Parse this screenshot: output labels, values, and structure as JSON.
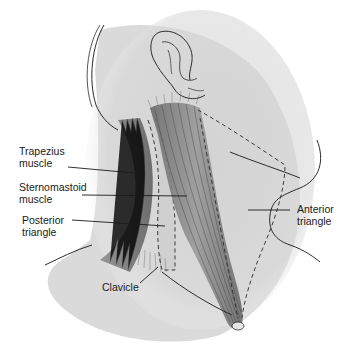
{
  "diagram": {
    "labels": [
      {
        "id": "trapezius",
        "text": "Trapezius\nmuscle",
        "x": 19,
        "y": 145
      },
      {
        "id": "sternomastoid",
        "text": "Sternomastoid\nmuscle",
        "x": 19,
        "y": 181
      },
      {
        "id": "posterior-triangle",
        "text": "Posterior\ntriangle",
        "x": 22,
        "y": 215
      },
      {
        "id": "anterior-triangle",
        "text": "Anterior\ntriangle",
        "x": 300,
        "y": 204
      },
      {
        "id": "clavicle",
        "text": "Clavicle",
        "x": 102,
        "y": 282
      }
    ],
    "colors": {
      "skin_shade": "#d9d9d9",
      "outline": "#2a2a2a",
      "muscle": "#8a8a8a",
      "muscle_dark": "#5e5e5e",
      "text": "#1a1a1a"
    }
  }
}
